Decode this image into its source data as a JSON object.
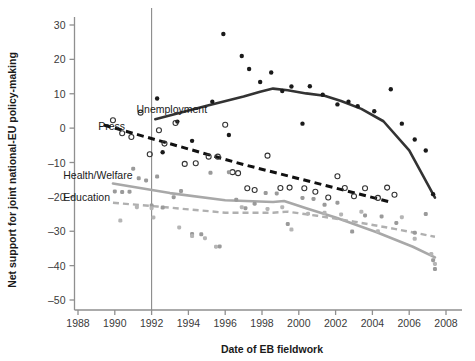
{
  "chart_data": {
    "type": "scatter",
    "title": "",
    "xlabel": "Date of EB fieldwork",
    "ylabel": "Net support for joint national-EU policy-making",
    "xlim": [
      1986.8,
      2009.2
    ],
    "ylim": [
      -55,
      33
    ],
    "xticks": [
      1988,
      1990,
      1992,
      1994,
      1996,
      1998,
      2000,
      2002,
      2004,
      2006,
      2008
    ],
    "yticks": [
      30,
      20,
      10,
      0,
      -10,
      -20,
      -30,
      -40,
      -50
    ],
    "ytick_labels": [
      "30",
      "20",
      "10",
      "0",
      "–10",
      "–20",
      "–30",
      "–40",
      "–50"
    ],
    "grid": false,
    "legend": "inline-labels",
    "annotations": [
      {
        "text": "Unemployment",
        "x": 1993.1,
        "y": 5.6,
        "anchor": "middle"
      },
      {
        "text": "Press",
        "x": 1989.1,
        "y": 0.6,
        "anchor": "start"
      },
      {
        "text": "Health/Welfare",
        "x": 1987.2,
        "y": -13.6,
        "anchor": "start"
      },
      {
        "text": "Education",
        "x": 1987.2,
        "y": -20.0,
        "anchor": "start"
      }
    ],
    "reference_line": {
      "orientation": "vertical",
      "x": 1992.0,
      "color": "#8a8a8a",
      "label": ""
    },
    "series": [
      {
        "name": "Unemployment",
        "marker": "filled-circle",
        "color": "#1a1a1a",
        "trend_style": "solid",
        "trend_color": "#333333",
        "points": [
          {
            "x": 1992.3,
            "y": 8.6
          },
          {
            "x": 1992.6,
            "y": -7.0
          },
          {
            "x": 1993.4,
            "y": 1.9
          },
          {
            "x": 1994.2,
            "y": -3.7
          },
          {
            "x": 1995.3,
            "y": 7.7
          },
          {
            "x": 1995.9,
            "y": 27.4
          },
          {
            "x": 1996.2,
            "y": -2.0
          },
          {
            "x": 1996.9,
            "y": 21.0
          },
          {
            "x": 1997.3,
            "y": 17.2
          },
          {
            "x": 1997.9,
            "y": 13.4
          },
          {
            "x": 1998.5,
            "y": 16.2
          },
          {
            "x": 1999.1,
            "y": 10.8
          },
          {
            "x": 1999.6,
            "y": 12.1
          },
          {
            "x": 2000.2,
            "y": 1.3
          },
          {
            "x": 2000.6,
            "y": 12.2
          },
          {
            "x": 2001.3,
            "y": 9.7
          },
          {
            "x": 2002.1,
            "y": 6.9
          },
          {
            "x": 2002.7,
            "y": 7.7
          },
          {
            "x": 2003.2,
            "y": 6.4
          },
          {
            "x": 2004.1,
            "y": 4.9
          },
          {
            "x": 2005.0,
            "y": 11.3
          },
          {
            "x": 2005.6,
            "y": 1.3
          },
          {
            "x": 2006.3,
            "y": -3.3
          },
          {
            "x": 2006.9,
            "y": -6.5
          },
          {
            "x": 2007.3,
            "y": -19.2
          }
        ],
        "trend": [
          {
            "x": 1992.2,
            "y": 2.6
          },
          {
            "x": 1995.0,
            "y": 6.5
          },
          {
            "x": 1997.0,
            "y": 9.2
          },
          {
            "x": 1997.9,
            "y": 10.6
          },
          {
            "x": 1998.6,
            "y": 11.5
          },
          {
            "x": 1999.4,
            "y": 11.0
          },
          {
            "x": 2000.4,
            "y": 10.1
          },
          {
            "x": 2001.4,
            "y": 9.4
          },
          {
            "x": 2002.3,
            "y": 7.9
          },
          {
            "x": 2003.4,
            "y": 5.6
          },
          {
            "x": 2004.6,
            "y": 2.0
          },
          {
            "x": 2006.0,
            "y": -6.5
          },
          {
            "x": 2007.4,
            "y": -20.2
          }
        ]
      },
      {
        "name": "Press",
        "marker": "open-circle",
        "color": "#333333",
        "trend_style": "dashed",
        "trend_color": "#111111",
        "points": [
          {
            "x": 1989.9,
            "y": 2.3
          },
          {
            "x": 1990.4,
            "y": -1.5
          },
          {
            "x": 1990.9,
            "y": -2.6
          },
          {
            "x": 1991.4,
            "y": 4.5
          },
          {
            "x": 1991.9,
            "y": -7.6
          },
          {
            "x": 1992.4,
            "y": -0.6
          },
          {
            "x": 1992.7,
            "y": -4.5
          },
          {
            "x": 1993.3,
            "y": 1.5
          },
          {
            "x": 1993.8,
            "y": -10.4
          },
          {
            "x": 1994.4,
            "y": -10.2
          },
          {
            "x": 1995.1,
            "y": -8.3
          },
          {
            "x": 1995.6,
            "y": -8.3
          },
          {
            "x": 1996.0,
            "y": 1.0
          },
          {
            "x": 1996.4,
            "y": -12.8
          },
          {
            "x": 1996.7,
            "y": -13.1
          },
          {
            "x": 1997.2,
            "y": -17.5
          },
          {
            "x": 1997.6,
            "y": -18.0
          },
          {
            "x": 1998.3,
            "y": -8.0
          },
          {
            "x": 1999.0,
            "y": -17.4
          },
          {
            "x": 1999.5,
            "y": -17.3
          },
          {
            "x": 2000.3,
            "y": -17.5
          },
          {
            "x": 2000.9,
            "y": -18.5
          },
          {
            "x": 2001.6,
            "y": -20.2
          },
          {
            "x": 2002.1,
            "y": -14.0
          },
          {
            "x": 2002.5,
            "y": -17.4
          },
          {
            "x": 2003.0,
            "y": -19.8
          },
          {
            "x": 2003.6,
            "y": -17.5
          },
          {
            "x": 2004.3,
            "y": -20.3
          },
          {
            "x": 2004.8,
            "y": -17.3
          },
          {
            "x": 2005.2,
            "y": -19.4
          }
        ],
        "trend": [
          {
            "x": 1989.4,
            "y": 0.9
          },
          {
            "x": 1997.0,
            "y": -10.6
          },
          {
            "x": 2004.9,
            "y": -21.4
          }
        ]
      },
      {
        "name": "Health/Welfare",
        "marker": "filled-circle-light",
        "color": "#9a9a9a",
        "trend_style": "solid",
        "trend_color": "#a8a8a8",
        "points": [
          {
            "x": 1990.0,
            "y": -18.4
          },
          {
            "x": 1990.4,
            "y": -18.6
          },
          {
            "x": 1990.8,
            "y": -18.5
          },
          {
            "x": 1991.0,
            "y": -11.8
          },
          {
            "x": 1991.3,
            "y": -14.6
          },
          {
            "x": 1991.7,
            "y": -15.2
          },
          {
            "x": 1992.0,
            "y": -22.5
          },
          {
            "x": 1992.3,
            "y": -14.1
          },
          {
            "x": 1992.6,
            "y": -23.1
          },
          {
            "x": 1993.2,
            "y": -20.1
          },
          {
            "x": 1993.6,
            "y": -18.3
          },
          {
            "x": 1994.2,
            "y": -30.8
          },
          {
            "x": 1994.7,
            "y": -30.9
          },
          {
            "x": 1995.2,
            "y": -13.0
          },
          {
            "x": 1995.7,
            "y": -34.4
          },
          {
            "x": 1996.2,
            "y": -12.8
          },
          {
            "x": 1996.6,
            "y": -20.8
          },
          {
            "x": 1997.1,
            "y": -23.3
          },
          {
            "x": 1997.6,
            "y": -22.0
          },
          {
            "x": 1998.2,
            "y": -18.9
          },
          {
            "x": 1998.8,
            "y": -19.0
          },
          {
            "x": 1999.4,
            "y": -27.9
          },
          {
            "x": 2000.2,
            "y": -20.3
          },
          {
            "x": 2000.8,
            "y": -20.6
          },
          {
            "x": 2001.4,
            "y": -22.3
          },
          {
            "x": 2002.1,
            "y": -21.7
          },
          {
            "x": 2002.9,
            "y": -30.1
          },
          {
            "x": 2003.6,
            "y": -25.4
          },
          {
            "x": 2004.5,
            "y": -25.7
          },
          {
            "x": 2005.3,
            "y": -27.6
          },
          {
            "x": 2006.3,
            "y": -30.4
          },
          {
            "x": 2006.9,
            "y": -25.0
          },
          {
            "x": 2007.3,
            "y": -38.4
          },
          {
            "x": 2007.4,
            "y": -41.0
          }
        ],
        "trend": [
          {
            "x": 1989.9,
            "y": -16.1
          },
          {
            "x": 1993.0,
            "y": -18.9
          },
          {
            "x": 1996.0,
            "y": -21.0
          },
          {
            "x": 1998.6,
            "y": -21.5
          },
          {
            "x": 1999.2,
            "y": -21.2
          },
          {
            "x": 2000.4,
            "y": -23.3
          },
          {
            "x": 2002.0,
            "y": -26.0
          },
          {
            "x": 2004.2,
            "y": -30.2
          },
          {
            "x": 2006.2,
            "y": -34.5
          },
          {
            "x": 2007.4,
            "y": -37.6
          }
        ]
      },
      {
        "name": "Education",
        "marker": "filled-circle-light",
        "color": "#b5b5b5",
        "trend_style": "dashed",
        "trend_color": "#b0b0b0",
        "points": [
          {
            "x": 1990.3,
            "y": -26.9
          },
          {
            "x": 1991.2,
            "y": -23.0
          },
          {
            "x": 1992.0,
            "y": -23.3
          },
          {
            "x": 1992.1,
            "y": -26.0
          },
          {
            "x": 1993.5,
            "y": -28.9
          },
          {
            "x": 1994.2,
            "y": -31.4
          },
          {
            "x": 1994.9,
            "y": -32.0
          },
          {
            "x": 1995.5,
            "y": -34.5
          },
          {
            "x": 1996.9,
            "y": -23.0
          },
          {
            "x": 1998.3,
            "y": -23.5
          },
          {
            "x": 1999.1,
            "y": -23.0
          },
          {
            "x": 1999.6,
            "y": -29.5
          },
          {
            "x": 2000.5,
            "y": -24.9
          },
          {
            "x": 2001.4,
            "y": -24.6
          },
          {
            "x": 2002.3,
            "y": -25.1
          },
          {
            "x": 2003.4,
            "y": -24.3
          },
          {
            "x": 2004.3,
            "y": -30.0
          },
          {
            "x": 2005.6,
            "y": -25.9
          },
          {
            "x": 2006.3,
            "y": -32.2
          },
          {
            "x": 2007.2,
            "y": -36.6
          },
          {
            "x": 2007.4,
            "y": -39.5
          }
        ],
        "trend": [
          {
            "x": 1989.9,
            "y": -21.7
          },
          {
            "x": 1992.3,
            "y": -22.8
          },
          {
            "x": 1996.0,
            "y": -24.6
          },
          {
            "x": 1998.6,
            "y": -24.6
          },
          {
            "x": 1999.4,
            "y": -24.3
          },
          {
            "x": 2001.0,
            "y": -25.5
          },
          {
            "x": 2003.0,
            "y": -27.2
          },
          {
            "x": 2005.2,
            "y": -29.3
          },
          {
            "x": 2007.4,
            "y": -31.6
          }
        ]
      }
    ]
  },
  "labels": {
    "xlabel": "Date of EB fieldwork",
    "ylabel": "Net support for joint national-EU policy-making"
  }
}
